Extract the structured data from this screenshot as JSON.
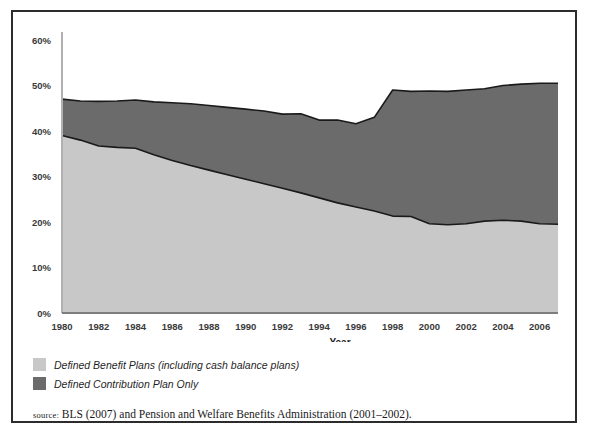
{
  "figure": {
    "source_prefix": "source:",
    "source_text": " BLS (2007) and Pension and Welfare Benefits Administration (2001–2002)."
  },
  "legend": {
    "items": [
      {
        "label": "Defined Benefit Plans (including cash balance plans)",
        "color": "#c8c8c8",
        "swatch_name": "legend-swatch-defined-benefit"
      },
      {
        "label": "Defined Contribution Plan Only",
        "color": "#6b6b6b",
        "swatch_name": "legend-swatch-defined-contribution"
      }
    ]
  },
  "chart_data": {
    "type": "area",
    "stacked": true,
    "title": "",
    "xlabel": "Year",
    "ylabel": "",
    "xlim": [
      1980,
      2007
    ],
    "ylim": [
      0,
      60
    ],
    "grid": false,
    "legend_position": "below",
    "ytick_labels": [
      "0%",
      "10%",
      "20%",
      "30%",
      "40%",
      "50%",
      "60%"
    ],
    "ytick_values": [
      0,
      10,
      20,
      30,
      40,
      50,
      60
    ],
    "xtick_labels": [
      "1980",
      "1982",
      "1984",
      "1986",
      "1988",
      "1990",
      "1992",
      "1994",
      "1996",
      "1998",
      "2000",
      "2002",
      "2004",
      "2006"
    ],
    "xtick_values": [
      1980,
      1982,
      1984,
      1986,
      1988,
      1990,
      1992,
      1994,
      1996,
      1998,
      2000,
      2002,
      2004,
      2006
    ],
    "x": [
      1980,
      1981,
      1982,
      1983,
      1984,
      1985,
      1986,
      1987,
      1988,
      1989,
      1990,
      1991,
      1992,
      1993,
      1994,
      1995,
      1996,
      1997,
      1998,
      1999,
      2000,
      2001,
      2002,
      2003,
      2004,
      2005,
      2006,
      2007
    ],
    "series": [
      {
        "name": "Defined Benefit Plans (including cash balance plans)",
        "color": "#c8c8c8",
        "values": [
          39.0,
          38.0,
          36.7,
          36.4,
          36.2,
          34.8,
          33.5,
          32.4,
          31.4,
          30.4,
          29.4,
          28.4,
          27.4,
          26.4,
          25.3,
          24.2,
          23.3,
          22.4,
          21.3,
          21.2,
          19.6,
          19.4,
          19.6,
          20.2,
          20.4,
          20.2,
          19.6,
          19.5
        ]
      },
      {
        "name": "Defined Contribution Plan Only",
        "color": "#6b6b6b",
        "values": [
          8.0,
          8.6,
          9.8,
          10.2,
          10.6,
          11.6,
          12.7,
          13.6,
          14.2,
          14.8,
          15.4,
          16.0,
          16.3,
          17.4,
          17.1,
          18.2,
          18.3,
          20.6,
          27.7,
          27.5,
          29.2,
          29.3,
          29.4,
          29.1,
          29.6,
          30.1,
          30.9,
          31.0
        ]
      }
    ],
    "totals": [
      47.0,
      46.6,
      46.5,
      46.6,
      46.8,
      46.4,
      46.2,
      46.0,
      45.6,
      45.2,
      44.8,
      44.4,
      43.7,
      43.8,
      42.4,
      42.4,
      41.6,
      43.0,
      49.0,
      48.7,
      48.8,
      48.7,
      49.0,
      49.3,
      50.0,
      50.3,
      50.5,
      50.5
    ]
  }
}
